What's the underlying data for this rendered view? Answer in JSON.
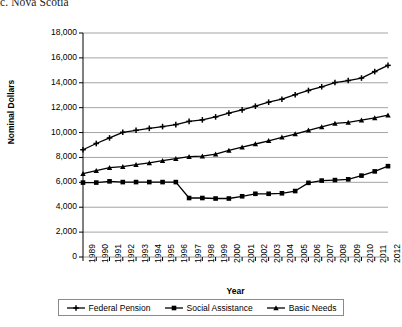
{
  "chart_title": "c. Nova Scotia",
  "axes": {
    "ylabel": "Nominal Dollars",
    "xlabel": "Year",
    "yticks": [
      "0",
      "2,000",
      "4,000",
      "6,000",
      "8,000",
      "10,000",
      "12,000",
      "14,000",
      "16,000",
      "18,000"
    ],
    "xticks": [
      "1989",
      "1990",
      "1991",
      "1992",
      "1993",
      "1994",
      "1995",
      "1996",
      "1997",
      "1998",
      "1999",
      "2000",
      "2001",
      "2002",
      "2003",
      "2004",
      "2005",
      "2006",
      "2007",
      "2008",
      "2009",
      "2010",
      "2011",
      "2012"
    ]
  },
  "legend": {
    "items": [
      {
        "label": "Federal Pension",
        "marker": "cross-marker"
      },
      {
        "label": "Social Assistance",
        "marker": "square-marker"
      },
      {
        "label": "Basic Needs",
        "marker": "triangle-marker"
      }
    ]
  },
  "chart_data": {
    "type": "line",
    "title": "c. Nova Scotia",
    "xlabel": "Year",
    "ylabel": "Nominal Dollars",
    "ylim": [
      0,
      18000
    ],
    "ytick_step": 2000,
    "grid": true,
    "legend_position": "bottom",
    "x": [
      1989,
      1990,
      1991,
      1992,
      1993,
      1994,
      1995,
      1996,
      1997,
      1998,
      1999,
      2000,
      2001,
      2002,
      2003,
      2004,
      2005,
      2006,
      2007,
      2008,
      2009,
      2010,
      2011,
      2012
    ],
    "series": [
      {
        "name": "Federal Pension",
        "marker": "cross",
        "color": "#000000",
        "values": [
          8620,
          9120,
          9570,
          10020,
          10180,
          10340,
          10480,
          10640,
          10900,
          11020,
          11260,
          11560,
          11820,
          12120,
          12440,
          12680,
          13040,
          13380,
          13680,
          14020,
          14180,
          14380,
          14900,
          15400
        ]
      },
      {
        "name": "Social Assistance",
        "marker": "square",
        "color": "#000000",
        "values": [
          5980,
          5980,
          6080,
          6020,
          6020,
          6020,
          6020,
          6020,
          4740,
          4740,
          4700,
          4700,
          4880,
          5080,
          5080,
          5120,
          5300,
          5960,
          6140,
          6180,
          6240,
          6540,
          6880,
          7300
        ]
      },
      {
        "name": "Basic Needs",
        "marker": "triangle",
        "color": "#000000",
        "values": [
          6700,
          6940,
          7180,
          7260,
          7420,
          7560,
          7740,
          7900,
          8060,
          8100,
          8260,
          8560,
          8820,
          9080,
          9340,
          9620,
          9880,
          10180,
          10460,
          10740,
          10820,
          11000,
          11180,
          11400
        ]
      }
    ]
  }
}
